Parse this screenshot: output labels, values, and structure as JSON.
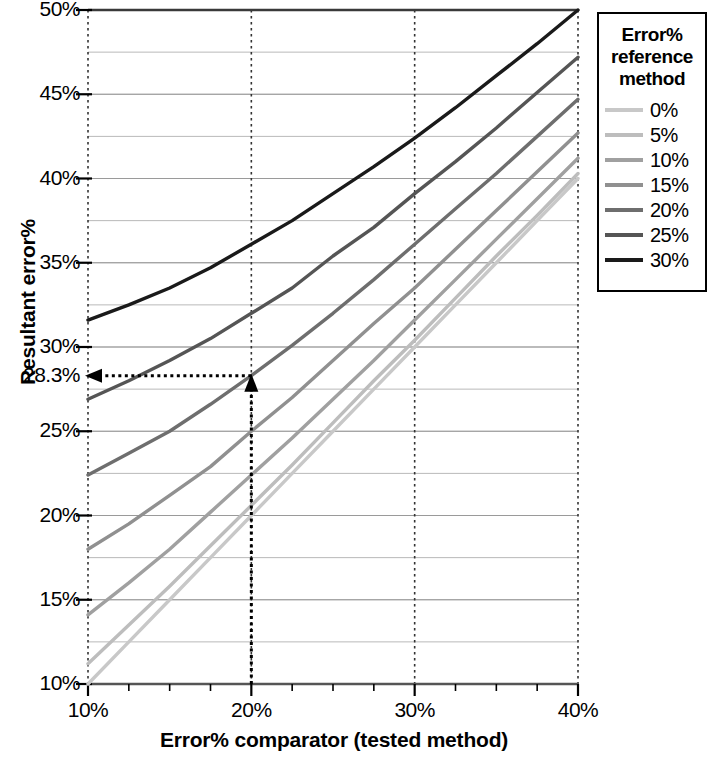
{
  "chart_data": {
    "type": "line",
    "title": "",
    "xlabel": "Error% comparator (tested method)",
    "ylabel": "Resultant error%",
    "xlim": [
      10,
      40
    ],
    "ylim": [
      10,
      50
    ],
    "xticks": [
      "10%",
      "20%",
      "30%",
      "40%"
    ],
    "xtick_values": [
      10,
      20,
      30,
      40
    ],
    "yticks": [
      "10%",
      "15%",
      "20%",
      "25%",
      "28.3%",
      "30%",
      "35%",
      "40%",
      "45%",
      "50%"
    ],
    "ytick_values": [
      10,
      15,
      20,
      25,
      28.3,
      30,
      35,
      40,
      45,
      50
    ],
    "grid": true,
    "grid_minor_step": 2.5,
    "legend_position": "right",
    "legend_title": "Error% reference method",
    "x": [
      10,
      12.5,
      15,
      17.5,
      20,
      22.5,
      25,
      27.5,
      30,
      32.5,
      35,
      37.5,
      40
    ],
    "series": [
      {
        "name": "0%",
        "color": "#c8c8c8",
        "values": [
          10.0,
          12.5,
          15.0,
          17.5,
          20.0,
          22.5,
          25.0,
          27.5,
          30.0,
          32.5,
          35.0,
          37.5,
          40.0
        ]
      },
      {
        "name": "5%",
        "color": "#bdbdbd",
        "values": [
          11.2,
          13.5,
          15.8,
          18.2,
          20.6,
          23.0,
          25.5,
          28.0,
          30.4,
          32.9,
          35.4,
          37.8,
          40.3
        ]
      },
      {
        "name": "10%",
        "color": "#a0a0a0",
        "values": [
          14.1,
          16.0,
          18.0,
          20.2,
          22.4,
          24.6,
          26.9,
          29.2,
          31.6,
          34.0,
          36.4,
          38.8,
          41.2
        ]
      },
      {
        "name": "15%",
        "color": "#909090",
        "values": [
          18.0,
          19.5,
          21.2,
          22.9,
          25.0,
          27.0,
          29.2,
          31.4,
          33.5,
          35.8,
          38.1,
          40.4,
          42.7
        ]
      },
      {
        "name": "20%",
        "color": "#6e6e6e",
        "values": [
          22.4,
          23.7,
          25.0,
          26.6,
          28.3,
          30.1,
          32.0,
          34.0,
          36.1,
          38.2,
          40.3,
          42.5,
          44.7
        ]
      },
      {
        "name": "25%",
        "color": "#555555",
        "values": [
          26.9,
          28.0,
          29.2,
          30.5,
          32.0,
          33.5,
          35.4,
          37.1,
          39.1,
          41.0,
          43.0,
          45.1,
          47.2
        ]
      },
      {
        "name": "30%",
        "color": "#1a1a1a",
        "values": [
          31.6,
          32.5,
          33.5,
          34.7,
          36.1,
          37.5,
          39.1,
          40.7,
          42.4,
          44.2,
          46.1,
          48.0,
          50.0
        ]
      }
    ],
    "annotation": {
      "label": "28.3%",
      "x_value": 20,
      "y_value": 28.3,
      "series_name": "20%",
      "style": "dotted-arrow"
    }
  },
  "legend": {
    "title_lines": [
      "Error%",
      "reference",
      "method"
    ],
    "items": [
      {
        "label": "0%",
        "color": "#c8c8c8"
      },
      {
        "label": "5%",
        "color": "#bdbdbd"
      },
      {
        "label": "10%",
        "color": "#a0a0a0"
      },
      {
        "label": "15%",
        "color": "#909090"
      },
      {
        "label": "20%",
        "color": "#6e6e6e"
      },
      {
        "label": "25%",
        "color": "#555555"
      },
      {
        "label": "30%",
        "color": "#1a1a1a"
      }
    ]
  },
  "axes": {
    "y_title": "Resultant error%",
    "x_title": "Error% comparator (tested method)"
  },
  "colors": {
    "axis": "#555555",
    "grid": "#b9b9b9",
    "annotation": "#000000",
    "text": "#000000"
  }
}
